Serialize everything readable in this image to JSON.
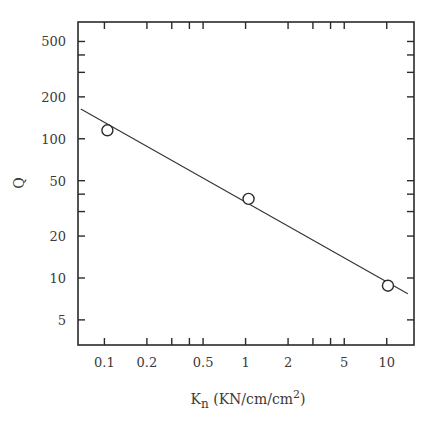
{
  "chart_data": {
    "type": "scatter",
    "title": "",
    "xlabel": "K",
    "xlabel_subscript": "n",
    "xlabel_units": " (KN/cm/cm",
    "xlabel_units_sup": "2",
    "xlabel_units_close": ")",
    "ylabel": "Q",
    "xscale": "log",
    "yscale": "log",
    "xlim": [
      0.065,
      15.6
    ],
    "ylim": [
      3.3,
      690
    ],
    "grid": false,
    "legend": "none",
    "x_ticks_major": [
      {
        "value": 0.1,
        "label": "0.1"
      },
      {
        "value": 0.2,
        "label": "0.2"
      },
      {
        "value": 0.5,
        "label": "0.5"
      },
      {
        "value": 1,
        "label": "1"
      },
      {
        "value": 2,
        "label": "2"
      },
      {
        "value": 5,
        "label": "5"
      },
      {
        "value": 10,
        "label": "10"
      }
    ],
    "x_ticks_minor": [
      0.3,
      0.4,
      3,
      4
    ],
    "y_ticks_major": [
      {
        "value": 5,
        "label": "5"
      },
      {
        "value": 10,
        "label": "10"
      },
      {
        "value": 20,
        "label": "20"
      },
      {
        "value": 50,
        "label": "50"
      },
      {
        "value": 100,
        "label": "100"
      },
      {
        "value": 200,
        "label": "200"
      },
      {
        "value": 500,
        "label": "500"
      }
    ],
    "y_ticks_minor": [
      30,
      40,
      300,
      400
    ],
    "series": [
      {
        "name": "measured",
        "marker": "open-circle",
        "points": [
          {
            "x": 0.105,
            "y": 115
          },
          {
            "x": 1.05,
            "y": 37
          },
          {
            "x": 10.2,
            "y": 8.8
          }
        ]
      },
      {
        "name": "fit",
        "style": "line",
        "points": [
          {
            "x": 0.068,
            "y": 164
          },
          {
            "x": 14.1,
            "y": 7.7
          }
        ]
      }
    ]
  }
}
